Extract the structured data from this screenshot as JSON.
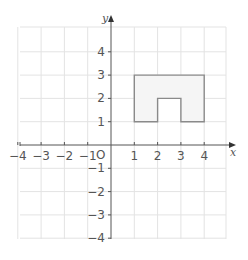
{
  "chart_data": {
    "type": "scatter",
    "title": "",
    "xlabel": "x",
    "ylabel": "y",
    "origin_label": "O",
    "xlim": [
      -4,
      4
    ],
    "ylim": [
      -4,
      4
    ],
    "grid": true,
    "x_ticks": [
      -4,
      -3,
      -2,
      -1,
      1,
      2,
      3,
      4
    ],
    "y_ticks": [
      4,
      3,
      2,
      1,
      -1,
      -2,
      -3,
      -4
    ],
    "x_tick_labels": [
      "−4",
      "−3",
      "−2",
      "−1",
      "1",
      "2",
      "3",
      "4"
    ],
    "y_tick_labels": [
      "4",
      "3",
      "2",
      "1",
      "−1",
      "−2",
      "−3",
      "−4"
    ],
    "series": [
      {
        "name": "shape",
        "kind": "polygon",
        "points": [
          [
            1,
            1
          ],
          [
            1,
            3
          ],
          [
            4,
            3
          ],
          [
            4,
            1
          ],
          [
            3,
            1
          ],
          [
            3,
            2
          ],
          [
            2,
            2
          ],
          [
            2,
            1
          ]
        ],
        "fill": "#f5f5f5",
        "stroke": "#8a8a8a"
      }
    ]
  },
  "colors": {
    "grid": "#e3e3e3",
    "axis": "#555555",
    "shape_fill": "#f5f5f5",
    "shape_stroke": "#8a8a8a"
  }
}
